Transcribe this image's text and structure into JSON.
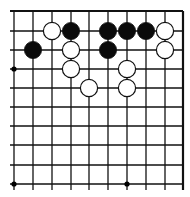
{
  "board": {
    "description": "Go board corner diagram (top-right corner region)",
    "x_lines": [
      14,
      33,
      52,
      71,
      89,
      108,
      127,
      146,
      165,
      183
    ],
    "y_lines": [
      11,
      31,
      50,
      69,
      88,
      107,
      126,
      145,
      165,
      184
    ],
    "line_color": "#111111",
    "edge_top_y": 11,
    "edge_right_x": 183,
    "star_points": [
      {
        "col": 0,
        "row": 3
      },
      {
        "col": 0,
        "row": 9
      },
      {
        "col": 6,
        "row": 9
      }
    ],
    "stones": [
      {
        "color": "white",
        "col": 2,
        "row": 1
      },
      {
        "color": "black",
        "col": 3,
        "row": 1
      },
      {
        "color": "black",
        "col": 5,
        "row": 1
      },
      {
        "color": "black",
        "col": 6,
        "row": 1
      },
      {
        "color": "black",
        "col": 7,
        "row": 1
      },
      {
        "color": "white",
        "col": 8,
        "row": 1
      },
      {
        "color": "black",
        "col": 1,
        "row": 2
      },
      {
        "color": "white",
        "col": 3,
        "row": 2
      },
      {
        "color": "black",
        "col": 5,
        "row": 2
      },
      {
        "color": "white",
        "col": 8,
        "row": 2
      },
      {
        "color": "white",
        "col": 3,
        "row": 3
      },
      {
        "color": "white",
        "col": 6,
        "row": 3
      },
      {
        "color": "white",
        "col": 4,
        "row": 4
      },
      {
        "color": "white",
        "col": 6,
        "row": 4
      }
    ]
  }
}
